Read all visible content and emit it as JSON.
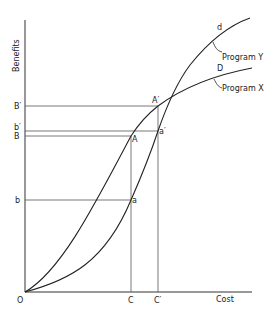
{
  "diagram": {
    "title": "",
    "axes": {
      "y_label": "Benefits",
      "x_label": "Cost",
      "origin_label": "O"
    },
    "y_ticks": {
      "B_prime": "B′",
      "b_prime": "b′",
      "B": "B",
      "b": "b"
    },
    "x_ticks": {
      "C": "C",
      "C_prime": "C′"
    },
    "points": {
      "A": "A",
      "A_prime": "A′",
      "a": "a",
      "a_prime": "a′"
    },
    "curves": {
      "program_y": {
        "end_label": "d",
        "name": "Program Y"
      },
      "program_x": {
        "end_label": "D",
        "name": "Program X"
      }
    },
    "colors": {
      "line": "#333333",
      "guide": "#555555",
      "background": "#ffffff"
    }
  }
}
